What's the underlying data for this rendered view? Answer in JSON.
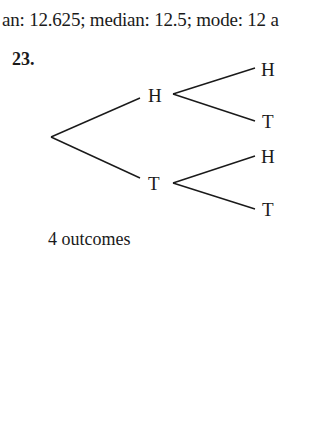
{
  "header": {
    "text": "an: 12.625; median: 12.5; mode: 12 a"
  },
  "problem": {
    "number": "23.",
    "tree": {
      "level1": [
        {
          "label": "H",
          "children": [
            {
              "label": "H"
            },
            {
              "label": "T"
            }
          ]
        },
        {
          "label": "T",
          "children": [
            {
              "label": "H"
            },
            {
              "label": "T"
            }
          ]
        }
      ]
    },
    "caption": "4 outcomes"
  }
}
